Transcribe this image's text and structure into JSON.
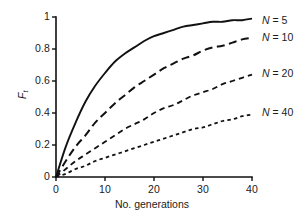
{
  "chart_data": {
    "type": "line",
    "title": "",
    "xlabel": "No. generations",
    "ylabel_main": "F",
    "ylabel_sub": "t",
    "xlim": [
      0,
      40
    ],
    "ylim": [
      0,
      1
    ],
    "xticks": [
      "0",
      "10",
      "20",
      "30",
      "40"
    ],
    "xtick_values": [
      0,
      10,
      20,
      30,
      40
    ],
    "yticks": [
      "0",
      "0.2",
      "0.4",
      "0.6",
      "0.8",
      "1"
    ],
    "ytick_values": [
      0,
      0.2,
      0.4,
      0.6,
      0.8,
      1
    ],
    "grid": false,
    "legend_position": "right-inline-labels",
    "x": [
      0,
      2,
      4,
      6,
      8,
      10,
      12,
      14,
      16,
      18,
      20,
      22,
      24,
      26,
      28,
      30,
      32,
      34,
      36,
      38,
      40
    ],
    "series": [
      {
        "name": "N = 5",
        "label_prefix": "N",
        "label_value": "= 5",
        "N": 5,
        "dash": "solid",
        "color": "#111111",
        "linewidth": 1.9,
        "values": [
          0,
          0.19,
          0.34,
          0.47,
          0.57,
          0.65,
          0.72,
          0.77,
          0.81,
          0.85,
          0.88,
          0.9,
          0.92,
          0.94,
          0.95,
          0.96,
          0.97,
          0.97,
          0.98,
          0.98,
          0.99
        ],
        "label_x": 262,
        "label_y": 14
      },
      {
        "name": "N = 10",
        "label_prefix": "N",
        "label_value": "= 10",
        "N": 10,
        "dash": "long",
        "color": "#111111",
        "linewidth": 2.0,
        "values": [
          0,
          0.1,
          0.19,
          0.26,
          0.34,
          0.4,
          0.46,
          0.51,
          0.56,
          0.6,
          0.64,
          0.68,
          0.71,
          0.74,
          0.76,
          0.79,
          0.81,
          0.82,
          0.84,
          0.86,
          0.87
        ],
        "label_x": 262,
        "label_y": 31
      },
      {
        "name": "N = 20",
        "label_prefix": "N",
        "label_value": "= 20",
        "N": 20,
        "dash": "medium",
        "color": "#111111",
        "linewidth": 1.8,
        "values": [
          0,
          0.05,
          0.1,
          0.14,
          0.18,
          0.22,
          0.26,
          0.3,
          0.33,
          0.36,
          0.4,
          0.43,
          0.45,
          0.48,
          0.51,
          0.53,
          0.55,
          0.58,
          0.6,
          0.62,
          0.64
        ],
        "label_x": 262,
        "label_y": 67
      },
      {
        "name": "N = 40",
        "label_prefix": "N",
        "label_value": "= 40",
        "N": 40,
        "dash": "short",
        "color": "#111111",
        "linewidth": 1.8,
        "values": [
          0,
          0.02,
          0.05,
          0.07,
          0.1,
          0.12,
          0.14,
          0.16,
          0.18,
          0.2,
          0.22,
          0.24,
          0.26,
          0.28,
          0.3,
          0.31,
          0.33,
          0.35,
          0.36,
          0.38,
          0.39
        ],
        "label_x": 262,
        "label_y": 106
      }
    ]
  },
  "axes": {
    "x_pixels": {
      "left": 56,
      "right": 252
    },
    "y_pixels": {
      "top": 17,
      "bottom": 177
    },
    "axis_color": "#111111"
  }
}
